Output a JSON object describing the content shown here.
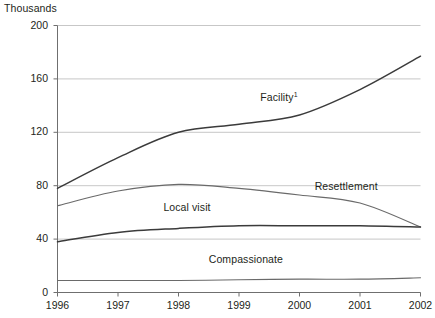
{
  "chart_data": {
    "type": "line",
    "title": "",
    "unit_label": "Thousands",
    "xlabel": "",
    "ylabel": "",
    "x": [
      1996,
      1997,
      1998,
      1999,
      2000,
      2001,
      2002
    ],
    "xtick_labels": [
      "1996",
      "1997",
      "1998",
      "1999",
      "2000",
      "2001",
      "2002"
    ],
    "xlim": [
      1996,
      2002
    ],
    "ylim": [
      0,
      200
    ],
    "ytick_labels": [
      "0",
      "40",
      "80",
      "120",
      "160",
      "200"
    ],
    "yticks": [
      0,
      40,
      80,
      120,
      160,
      200
    ],
    "grid": true,
    "legend_position": "inline-annotations",
    "series": [
      {
        "name": "Facility",
        "label": "Facility",
        "footnote_marker": "1",
        "values": [
          78,
          101,
          120,
          126,
          133,
          152,
          177
        ],
        "color": "#3b3b3b",
        "label_x": 1999.35,
        "label_y": 146
      },
      {
        "name": "Resettlement",
        "label": "Resettlement",
        "footnote_marker": "",
        "values": [
          65,
          76,
          81,
          78,
          73,
          67,
          49
        ],
        "color": "#6a6a6a",
        "label_x": 2000.25,
        "label_y": 79
      },
      {
        "name": "Local visit",
        "label": "Local visit",
        "footnote_marker": "",
        "values": [
          38,
          45,
          48,
          50,
          50,
          50,
          49
        ],
        "color": "#3b3b3b",
        "label_x": 1997.75,
        "label_y": 63
      },
      {
        "name": "Compassionate",
        "label": "Compassionate",
        "footnote_marker": "",
        "values": [
          9,
          9,
          9,
          9.5,
          10,
          10,
          11
        ],
        "color": "#6a6a6a",
        "label_x": 1998.5,
        "label_y": 24
      }
    ]
  }
}
